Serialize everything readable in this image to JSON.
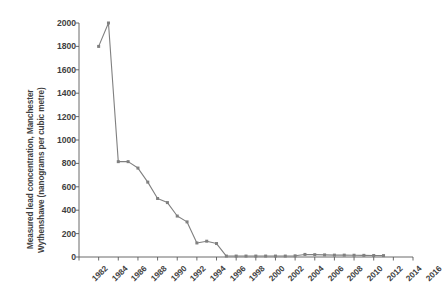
{
  "chart_data": {
    "type": "line",
    "title": "",
    "xlabel": "",
    "ylabel": "Measured lead concentration, Manchester Wythenshawe (nanograms per cubic metre)",
    "ylabel_lines": [
      "Measured lead concentration, Manchester",
      "Wythenshawe (nanograms per cubic metre)"
    ],
    "xlim": [
      1982,
      2016
    ],
    "ylim": [
      0,
      2000
    ],
    "yticks": [
      0,
      200,
      400,
      600,
      800,
      1000,
      1200,
      1400,
      1600,
      1800,
      2000
    ],
    "ytick_labels": [
      "0",
      "200",
      "400",
      "600",
      "800",
      "1000",
      "1200",
      "1400",
      "1600",
      "1800",
      "2000"
    ],
    "xticks": [
      1982,
      1984,
      1986,
      1988,
      1990,
      1992,
      1994,
      1996,
      1998,
      2000,
      2002,
      2004,
      2006,
      2008,
      2010,
      2012,
      2014,
      2016
    ],
    "xtick_labels": [
      "1982",
      "1984",
      "1986",
      "1988",
      "1990",
      "1992",
      "1994",
      "1996",
      "1998",
      "2000",
      "2002",
      "2004",
      "2006",
      "2008",
      "2010",
      "2012",
      "2014",
      "2016"
    ],
    "grid": false,
    "legend": false,
    "series": [
      {
        "name": "Measured lead concentration",
        "color": "#808080",
        "marker": "square",
        "x": [
          1984,
          1985,
          1986,
          1987,
          1988,
          1989,
          1990,
          1991,
          1992,
          1993,
          1994,
          1995,
          1996,
          1997,
          1998,
          1999,
          2000,
          2001,
          2002,
          2003,
          2004,
          2005,
          2006,
          2007,
          2008,
          2009,
          2010,
          2011,
          2012,
          2013
        ],
        "values": [
          1800,
          2000,
          815,
          815,
          760,
          640,
          500,
          465,
          350,
          300,
          120,
          135,
          115,
          8,
          8,
          8,
          8,
          8,
          8,
          8,
          10,
          22,
          20,
          18,
          16,
          16,
          15,
          14,
          13,
          12
        ]
      }
    ]
  },
  "axis": {
    "line_color": "#595959",
    "tick_color": "#595959",
    "text_color": "#3f3f3f"
  }
}
